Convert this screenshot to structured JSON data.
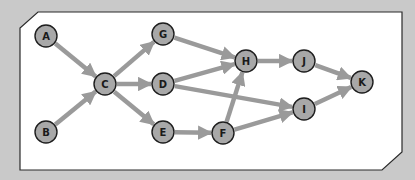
{
  "diagram": {
    "type": "directed-graph",
    "colors": {
      "background": "#c9c9c9",
      "panel_fill": "#ffffff",
      "panel_border": "#2a2a2a",
      "node_fill": "#a8a8a8",
      "node_stroke": "#1e1e1e",
      "edge": "#9a9a9a",
      "label": "#1a1a1a"
    },
    "nodes": [
      {
        "id": "A",
        "label": "A",
        "x": 46,
        "y": 36
      },
      {
        "id": "B",
        "label": "B",
        "x": 46,
        "y": 132
      },
      {
        "id": "C",
        "label": "C",
        "x": 105,
        "y": 84
      },
      {
        "id": "G",
        "label": "G",
        "x": 163,
        "y": 34
      },
      {
        "id": "D",
        "label": "D",
        "x": 163,
        "y": 84
      },
      {
        "id": "E",
        "label": "E",
        "x": 163,
        "y": 132
      },
      {
        "id": "F",
        "label": "F",
        "x": 223,
        "y": 133
      },
      {
        "id": "H",
        "label": "H",
        "x": 246,
        "y": 61
      },
      {
        "id": "J",
        "label": "J",
        "x": 304,
        "y": 61
      },
      {
        "id": "I",
        "label": "I",
        "x": 304,
        "y": 109
      },
      {
        "id": "K",
        "label": "K",
        "x": 362,
        "y": 82
      }
    ],
    "edges": [
      {
        "from": "A",
        "to": "C"
      },
      {
        "from": "B",
        "to": "C"
      },
      {
        "from": "C",
        "to": "G"
      },
      {
        "from": "C",
        "to": "D"
      },
      {
        "from": "C",
        "to": "E"
      },
      {
        "from": "G",
        "to": "H"
      },
      {
        "from": "D",
        "to": "H"
      },
      {
        "from": "D",
        "to": "I"
      },
      {
        "from": "E",
        "to": "F"
      },
      {
        "from": "F",
        "to": "H"
      },
      {
        "from": "F",
        "to": "I"
      },
      {
        "from": "H",
        "to": "J"
      },
      {
        "from": "J",
        "to": "K"
      },
      {
        "from": "I",
        "to": "K"
      }
    ]
  }
}
